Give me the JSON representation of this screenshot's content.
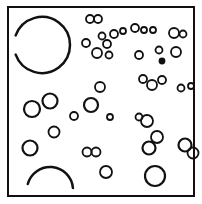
{
  "figure": {
    "width": 202,
    "height": 204,
    "stroke_color": "#111111",
    "background": "#ffffff",
    "frame": {
      "x": 8,
      "y": 7,
      "w": 186,
      "h": 189
    },
    "arcs": [
      {
        "cx": 42,
        "cy": 45,
        "r": 28,
        "start": 200,
        "end": 520
      },
      {
        "cx": 50,
        "cy": 190,
        "r": 23,
        "start": 195,
        "end": 355
      }
    ],
    "circles": [
      {
        "cx": 90,
        "cy": 19,
        "r": 4
      },
      {
        "cx": 98,
        "cy": 19,
        "r": 4
      },
      {
        "cx": 102,
        "cy": 36,
        "r": 3.5
      },
      {
        "cx": 114,
        "cy": 34,
        "r": 4
      },
      {
        "cx": 123,
        "cy": 31,
        "r": 3
      },
      {
        "cx": 135,
        "cy": 28,
        "r": 4
      },
      {
        "cx": 144,
        "cy": 30,
        "r": 3
      },
      {
        "cx": 153,
        "cy": 30,
        "r": 3
      },
      {
        "cx": 174,
        "cy": 33,
        "r": 5
      },
      {
        "cx": 183,
        "cy": 34,
        "r": 3.5
      },
      {
        "cx": 86,
        "cy": 43,
        "r": 4
      },
      {
        "cx": 97,
        "cy": 53,
        "r": 5
      },
      {
        "cx": 107,
        "cy": 44,
        "r": 4
      },
      {
        "cx": 109,
        "cy": 55,
        "r": 3.5
      },
      {
        "cx": 139,
        "cy": 55,
        "r": 4
      },
      {
        "cx": 159,
        "cy": 50,
        "r": 3.5
      },
      {
        "cx": 176,
        "cy": 52,
        "r": 5
      },
      {
        "cx": 162,
        "cy": 61,
        "r": 2.5,
        "filled": true
      },
      {
        "cx": 143,
        "cy": 79,
        "r": 4
      },
      {
        "cx": 152,
        "cy": 85,
        "r": 5
      },
      {
        "cx": 162,
        "cy": 80,
        "r": 4
      },
      {
        "cx": 181,
        "cy": 88,
        "r": 3.5
      },
      {
        "cx": 191,
        "cy": 86,
        "r": 3
      },
      {
        "cx": 100,
        "cy": 87,
        "r": 5
      },
      {
        "cx": 91,
        "cy": 105,
        "r": 7
      },
      {
        "cx": 74,
        "cy": 116,
        "r": 4
      },
      {
        "cx": 110,
        "cy": 117,
        "r": 3
      },
      {
        "cx": 32,
        "cy": 109,
        "r": 8
      },
      {
        "cx": 50,
        "cy": 101,
        "r": 7.5
      },
      {
        "cx": 54,
        "cy": 132,
        "r": 5.5
      },
      {
        "cx": 30,
        "cy": 148,
        "r": 7.5
      },
      {
        "cx": 139,
        "cy": 117,
        "r": 3.5
      },
      {
        "cx": 147,
        "cy": 121,
        "r": 6
      },
      {
        "cx": 157,
        "cy": 137,
        "r": 6
      },
      {
        "cx": 149,
        "cy": 148,
        "r": 6.5
      },
      {
        "cx": 185,
        "cy": 145,
        "r": 6.5
      },
      {
        "cx": 193,
        "cy": 153,
        "r": 5.5
      },
      {
        "cx": 87,
        "cy": 152,
        "r": 4.5
      },
      {
        "cx": 96,
        "cy": 152,
        "r": 4.5
      },
      {
        "cx": 106,
        "cy": 172,
        "r": 6
      },
      {
        "cx": 155,
        "cy": 176,
        "r": 10
      },
      {
        "cx": 107,
        "cy": 117,
        "r": 0
      }
    ]
  }
}
